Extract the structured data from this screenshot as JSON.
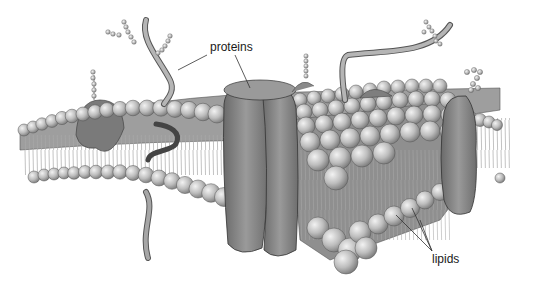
{
  "diagram": {
    "labels": {
      "proteins": "proteins",
      "lipids": "lipids"
    },
    "colors": {
      "background": "#ffffff",
      "lipid_head": "#c8c8c8",
      "lipid_head_dark": "#8a8a8a",
      "protein": "#8c8c8c",
      "protein_dark": "#5e5e5e",
      "tail": "#9a9a9a",
      "line": "#333333"
    }
  }
}
